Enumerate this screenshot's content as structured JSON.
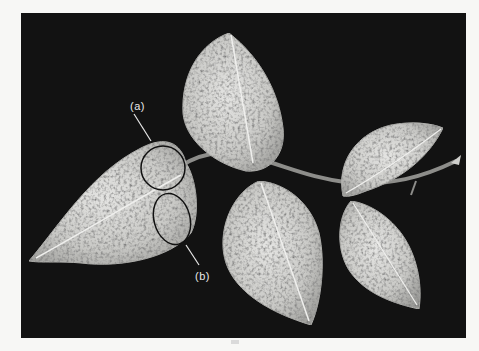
{
  "figure": {
    "background_color": "#121212",
    "page_color": "#f7f7f5",
    "annotations": [
      {
        "id": "a",
        "label": "(a)",
        "marker": "circle-outline-ellipse"
      },
      {
        "id": "b",
        "label": "(b)",
        "marker": "circle-outline-ellipse"
      }
    ]
  }
}
